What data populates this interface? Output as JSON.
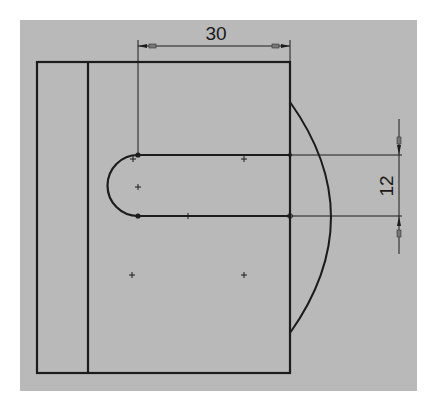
{
  "sketch": {
    "background_color": "#b9b9b9",
    "line_color": "#1c1c1c",
    "dimensions": {
      "horizontal": {
        "label": "30"
      },
      "vertical": {
        "label": "12"
      }
    },
    "entities": {
      "outer_rectangle": "rectangle",
      "inner_vertical_line": "line",
      "slot": "straight-slot",
      "arc": "arc"
    }
  }
}
